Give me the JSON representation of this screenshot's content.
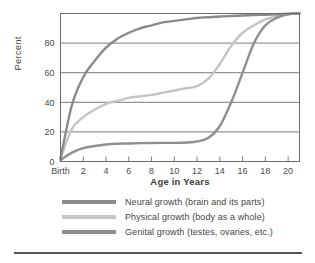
{
  "chart_data": {
    "type": "line",
    "title": "",
    "xlabel": "Age in Years",
    "ylabel": "Percent",
    "xlim": [
      0,
      21
    ],
    "ylim": [
      0,
      100
    ],
    "grid": true,
    "legend_position": "below",
    "x_tick_labels": [
      "Birth",
      "2",
      "4",
      "6",
      "8",
      "10",
      "12",
      "14",
      "16",
      "18",
      "20"
    ],
    "x_tick_values": [
      0,
      2,
      4,
      6,
      8,
      10,
      12,
      14,
      16,
      18,
      20
    ],
    "y_tick_labels": [
      "0",
      "20",
      "40",
      "60",
      "80"
    ],
    "y_tick_values": [
      0,
      20,
      40,
      60,
      80
    ],
    "x": [
      0,
      1,
      2,
      3,
      4,
      5,
      6,
      7,
      8,
      9,
      10,
      11,
      12,
      13,
      14,
      15,
      16,
      17,
      18,
      19,
      20,
      21
    ],
    "series": [
      {
        "name": "Neural growth (brain and its parts)",
        "color": "#8a8a8a",
        "values": [
          2,
          38,
          57,
          68,
          77,
          83,
          87,
          90,
          92,
          94,
          95,
          96,
          97,
          97.5,
          98,
          98.3,
          98.6,
          99,
          99.2,
          99.5,
          99.8,
          100
        ]
      },
      {
        "name": "Physical growth (body as a whole)",
        "color": "#c4c4c4",
        "values": [
          2,
          22,
          30,
          35,
          39,
          41,
          43,
          44,
          45,
          46.5,
          48,
          49.5,
          51,
          56,
          66,
          78,
          87,
          92,
          96,
          98,
          99.5,
          100
        ]
      },
      {
        "name": "Genital growth (testes, ovaries, etc.)",
        "color": "#909090",
        "values": [
          1,
          6,
          9,
          10.5,
          11.5,
          12,
          12.2,
          12.4,
          12.5,
          12.6,
          12.6,
          12.8,
          13.5,
          16,
          24,
          40,
          60,
          80,
          92,
          97,
          99.5,
          100
        ]
      }
    ]
  },
  "legend": [
    {
      "label": "Neural growth (brain and its parts)",
      "color": "#8a8a8a"
    },
    {
      "label": "Physical growth (body as a whole)",
      "color": "#c6c6c6"
    },
    {
      "label": "Genital growth (testes, ovaries, etc.)",
      "color": "#8c8c8c"
    }
  ],
  "axes": {
    "y_title": "Percent",
    "x_title": "Age in Years"
  }
}
